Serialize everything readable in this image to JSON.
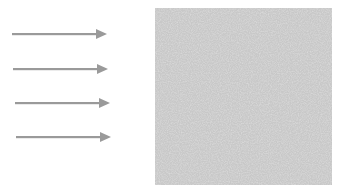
{
  "diagram": {
    "colors": {
      "background": "#ffffff",
      "arrow": "#9a9a9a",
      "surface": "#c8c8c8",
      "surface_speckle": "#e4e4e4"
    },
    "arrows": [
      {
        "x1": 12,
        "x2": 107,
        "y": 34,
        "direction": "right"
      },
      {
        "x1": 13,
        "x2": 108,
        "y": 69,
        "direction": "right"
      },
      {
        "x1": 15,
        "x2": 110,
        "y": 103,
        "direction": "right"
      },
      {
        "x1": 16,
        "x2": 111,
        "y": 137,
        "direction": "right"
      }
    ],
    "surface": {
      "x": 155,
      "y": 8,
      "width": 177,
      "height": 177,
      "texture": "speckled"
    }
  }
}
